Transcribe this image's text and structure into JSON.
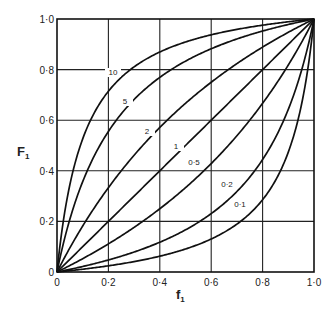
{
  "chart_data": {
    "type": "line",
    "title": "",
    "xlabel": "f1",
    "ylabel": "F1",
    "xlim": [
      0,
      1
    ],
    "ylim": [
      0,
      1
    ],
    "grid": true,
    "legend": "inline curve labels",
    "x_ticks": [
      "0",
      "0·2",
      "0·4",
      "0·6",
      "0·8",
      "1·0"
    ],
    "y_ticks": [
      "0",
      "0·2",
      "0·4",
      "0·6",
      "0·8",
      "1·0"
    ],
    "x": [
      0,
      0.1,
      0.2,
      0.3,
      0.4,
      0.5,
      0.6,
      0.7,
      0.8,
      0.9,
      1.0
    ],
    "series": [
      {
        "name": "10",
        "r": 10,
        "label": "10",
        "values": [
          0,
          0.526,
          0.714,
          0.811,
          0.87,
          0.909,
          0.938,
          0.959,
          0.976,
          0.989,
          1.0
        ]
      },
      {
        "name": "5",
        "r": 5,
        "label": "5",
        "values": [
          0,
          0.357,
          0.556,
          0.682,
          0.769,
          0.833,
          0.882,
          0.921,
          0.952,
          0.978,
          1.0
        ]
      },
      {
        "name": "2",
        "r": 2,
        "label": "2",
        "values": [
          0,
          0.182,
          0.333,
          0.462,
          0.571,
          0.667,
          0.75,
          0.824,
          0.889,
          0.947,
          1.0
        ]
      },
      {
        "name": "1",
        "r": 1,
        "label": "1",
        "values": [
          0,
          0.1,
          0.2,
          0.3,
          0.4,
          0.5,
          0.6,
          0.7,
          0.8,
          0.9,
          1.0
        ]
      },
      {
        "name": "0.5",
        "r": 0.5,
        "label": "0·5",
        "values": [
          0,
          0.053,
          0.111,
          0.176,
          0.25,
          0.333,
          0.429,
          0.538,
          0.667,
          0.818,
          1.0
        ]
      },
      {
        "name": "0.2",
        "r": 0.2,
        "label": "0·2",
        "values": [
          0,
          0.022,
          0.048,
          0.079,
          0.118,
          0.167,
          0.231,
          0.318,
          0.444,
          0.643,
          1.0
        ]
      },
      {
        "name": "0.1",
        "r": 0.1,
        "label": "0·1",
        "values": [
          0,
          0.011,
          0.024,
          0.041,
          0.063,
          0.091,
          0.13,
          0.189,
          0.286,
          0.474,
          1.0
        ]
      }
    ]
  },
  "labels": {
    "x_title": "f",
    "x_sub": "1",
    "y_title": "F",
    "y_sub": "1"
  }
}
